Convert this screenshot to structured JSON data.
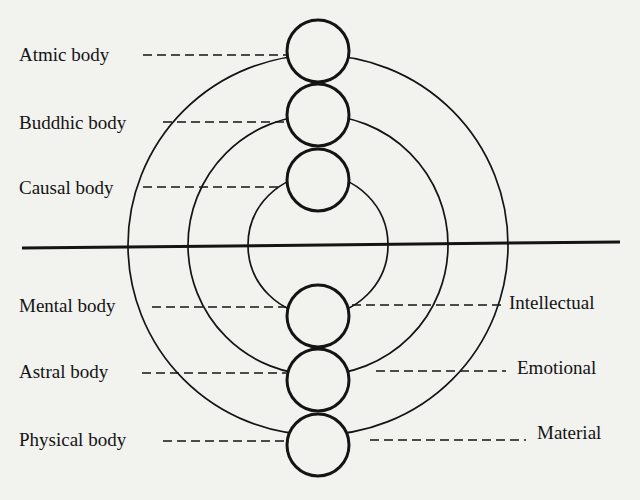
{
  "diagram": {
    "colors": {
      "background": "#f2f2ef",
      "ink": "#141414"
    },
    "center": {
      "x": 318,
      "y": 245
    },
    "rings": [
      {
        "name": "inner-ring",
        "r": 70
      },
      {
        "name": "middle-ring",
        "r": 130
      },
      {
        "name": "outer-ring",
        "r": 190
      }
    ],
    "divider": {
      "x1": 22,
      "y1": 248,
      "x2": 620,
      "y2": 242
    },
    "upper_bodies": [
      {
        "label": "Atmic body",
        "cy": 51,
        "label_x": 18,
        "label_y": 44,
        "dash_x1": 143,
        "dash_x2": 286,
        "dash_y": 55
      },
      {
        "label": "Buddhic body",
        "cy": 115,
        "label_x": 18,
        "label_y": 112,
        "dash_x1": 163,
        "dash_x2": 286,
        "dash_y": 122
      },
      {
        "label": "Causal body",
        "cy": 180,
        "label_x": 18,
        "label_y": 177,
        "dash_x1": 143,
        "dash_x2": 282,
        "dash_y": 187
      }
    ],
    "lower_bodies": [
      {
        "label": "Mental body",
        "cy": 316,
        "label_x": 18,
        "label_y": 295,
        "dash_x1": 152,
        "dash_x2": 286,
        "dash_y": 307
      },
      {
        "label": "Astral body",
        "cy": 380,
        "label_x": 18,
        "label_y": 361,
        "dash_x1": 142,
        "dash_x2": 286,
        "dash_y": 373
      },
      {
        "label": "Physical body",
        "cy": 445,
        "label_x": 18,
        "label_y": 429,
        "dash_x1": 163,
        "dash_x2": 286,
        "dash_y": 441
      }
    ],
    "planes": [
      {
        "label": "Intellectual",
        "label_x": 508,
        "label_y": 292,
        "dash_x1": 352,
        "dash_x2": 504,
        "dash_y": 305
      },
      {
        "label": "Emotional",
        "label_x": 516,
        "label_y": 357,
        "dash_x1": 376,
        "dash_x2": 506,
        "dash_y": 371
      },
      {
        "label": "Material",
        "label_x": 536,
        "label_y": 422,
        "dash_x1": 370,
        "dash_x2": 526,
        "dash_y": 440
      }
    ],
    "small_circle": {
      "cx": 318,
      "r": 31
    }
  }
}
